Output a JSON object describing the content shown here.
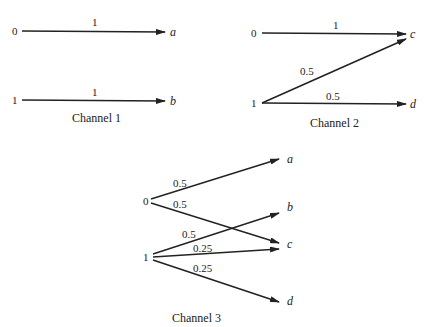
{
  "channels": [
    {
      "caption": "Channel 1",
      "inputs": [
        "0",
        "1"
      ],
      "outputs": [
        "a",
        "b"
      ],
      "edges": [
        {
          "from": "0",
          "to": "a",
          "prob": "1"
        },
        {
          "from": "1",
          "to": "b",
          "prob": "1"
        }
      ]
    },
    {
      "caption": "Channel 2",
      "inputs": [
        "0",
        "1"
      ],
      "outputs": [
        "c",
        "d"
      ],
      "edges": [
        {
          "from": "0",
          "to": "c",
          "prob": "1"
        },
        {
          "from": "1",
          "to": "c",
          "prob": "0.5"
        },
        {
          "from": "1",
          "to": "d",
          "prob": "0.5"
        }
      ]
    },
    {
      "caption": "Channel 3",
      "inputs": [
        "0",
        "1"
      ],
      "outputs": [
        "a",
        "b",
        "c",
        "d"
      ],
      "edges": [
        {
          "from": "0",
          "to": "a",
          "prob": "0.5"
        },
        {
          "from": "0",
          "to": "c",
          "prob": "0.5"
        },
        {
          "from": "1",
          "to": "b",
          "prob": "0.5"
        },
        {
          "from": "1",
          "to": "c",
          "prob": "0.25"
        },
        {
          "from": "1",
          "to": "d",
          "prob": "0.25"
        }
      ]
    }
  ]
}
